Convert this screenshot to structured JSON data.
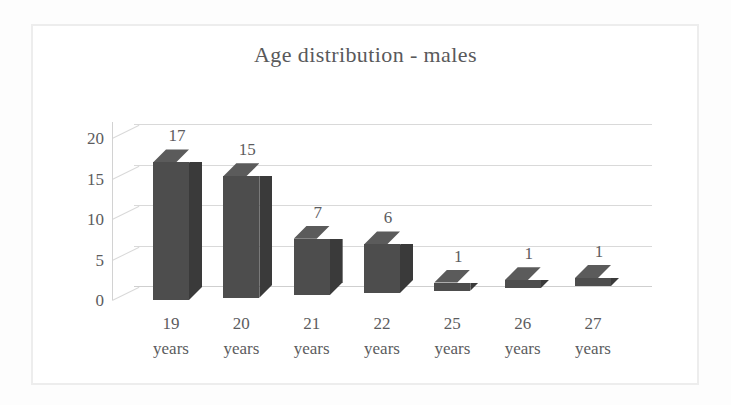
{
  "chart_data": {
    "type": "bar",
    "title": "Age distribution - males",
    "xlabel": "",
    "ylabel": "",
    "categories": [
      "19 years",
      "20 years",
      "21 years",
      "22 years",
      "25 years",
      "26 years",
      "27 years"
    ],
    "category_values": [
      "19",
      "20",
      "21",
      "22",
      "25",
      "26",
      "27"
    ],
    "category_unit": "years",
    "values": [
      17,
      15,
      7,
      6,
      1,
      1,
      1
    ],
    "data_labels": [
      "17",
      "15",
      "7",
      "6",
      "1",
      "1",
      "1"
    ],
    "ylim": [
      0,
      22
    ],
    "y_ticks": [
      0,
      5,
      10,
      15,
      20
    ],
    "y_tick_labels": [
      "0",
      "5",
      "10",
      "15",
      "20"
    ],
    "grid": true,
    "grid_axis": "y",
    "legend": false,
    "legend_position": "none",
    "style": "3d-column",
    "series": [
      {
        "name": "Age distribution - males",
        "values": [
          17,
          15,
          7,
          6,
          1,
          1,
          1
        ]
      }
    ]
  },
  "colors": {
    "bar_front": "#4d4d4d",
    "bar_side": "#3a3a3a",
    "bar_top": "#5b5b5b",
    "gridline": "#d9d9d9",
    "text": "#5c5c5e",
    "frame": "#ededed",
    "background": "#ffffff"
  }
}
